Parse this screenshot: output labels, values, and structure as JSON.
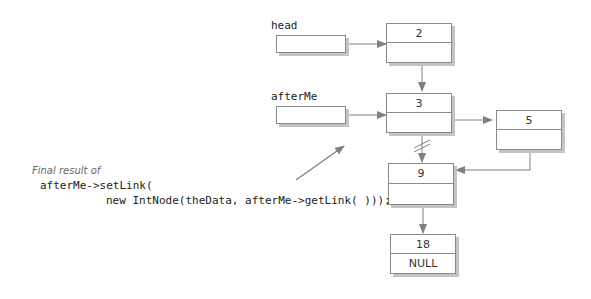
{
  "pointers": {
    "head": {
      "label": "head"
    },
    "afterMe": {
      "label": "afterMe"
    }
  },
  "nodes": [
    {
      "id": "n2",
      "data": "2",
      "link": ""
    },
    {
      "id": "n3",
      "data": "3",
      "link": ""
    },
    {
      "id": "n5",
      "data": "5",
      "link": ""
    },
    {
      "id": "n9",
      "data": "9",
      "link": ""
    },
    {
      "id": "n18",
      "data": "18",
      "link": "NULL"
    }
  ],
  "caption": {
    "title": "Final result of",
    "code_line1": "afterMe->setLink(",
    "code_line2": "new IntNode(theData, afterMe->getLink( )));"
  },
  "colors": {
    "line": "#808080",
    "box_border": "#8a8a8a",
    "shadow": "#c4c4c4",
    "caption": "#666666"
  }
}
